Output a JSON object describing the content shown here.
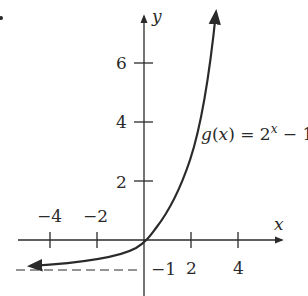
{
  "chart_data": {
    "type": "line",
    "title": "",
    "function_label": "g(x) = 2^x − 1",
    "function_label_parts": {
      "lhs": "g(x) = 2",
      "exp": "x",
      "rhs": " − 1"
    },
    "xlabel": "x",
    "ylabel": "y",
    "x_ticks": [
      -4,
      -2,
      2,
      4
    ],
    "x_tick_labels": [
      "−4",
      "−2",
      "2",
      "4"
    ],
    "y_ticks": [
      2,
      4,
      6
    ],
    "y_tick_labels": [
      "2",
      "4",
      "6"
    ],
    "asymptote": {
      "y": -1,
      "label": "−1",
      "style": "dashed"
    },
    "xlim": [
      -5.3,
      5.8
    ],
    "ylim": [
      -1.8,
      7.9
    ],
    "grid": false,
    "series": [
      {
        "name": "g(x) = 2^x − 1",
        "x": [
          -5,
          -4,
          -3,
          -2,
          -1,
          0,
          1,
          2,
          3,
          3.1
        ],
        "values": [
          -0.97,
          -0.94,
          -0.875,
          -0.75,
          -0.5,
          0,
          1,
          3,
          7,
          7.57
        ]
      }
    ]
  },
  "colors": {
    "ink": "#2a2a2a",
    "background": "#ffffff"
  }
}
